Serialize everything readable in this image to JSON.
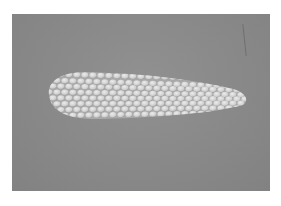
{
  "image": {
    "subject": "ear of corn",
    "style": "grayscale photograph",
    "colors": {
      "background": "#8a8a8a",
      "kernel": "#dcdcdc",
      "kernel_shadow": "#a8a8a8",
      "frame": "#ffffff"
    }
  }
}
